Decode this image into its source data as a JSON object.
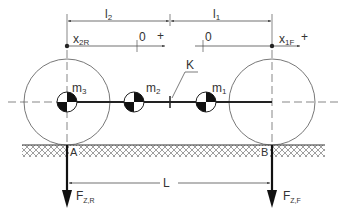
{
  "diagram": {
    "colors": {
      "line": "#333333",
      "thin": "#555555",
      "hatch": "#777777",
      "background": "#ffffff"
    },
    "dimensions": {
      "l2": "l",
      "l2_sub": "2",
      "l1": "l",
      "l1_sub": "1",
      "L": "L"
    },
    "axes": {
      "rear": {
        "label": "x",
        "sub": "2R",
        "zero": "0",
        "plus": "+"
      },
      "front": {
        "label": "x",
        "sub": "1F",
        "zero": "0",
        "plus": "+"
      }
    },
    "masses": [
      {
        "label": "m",
        "sub": "3"
      },
      {
        "label": "m",
        "sub": "2"
      },
      {
        "label": "m",
        "sub": "1"
      }
    ],
    "coupling_point": "K",
    "contact_points": {
      "rear": "A",
      "front": "B"
    },
    "forces": {
      "rear": {
        "label": "F",
        "sub": "Z,R"
      },
      "front": {
        "label": "F",
        "sub": "Z,F"
      }
    }
  }
}
